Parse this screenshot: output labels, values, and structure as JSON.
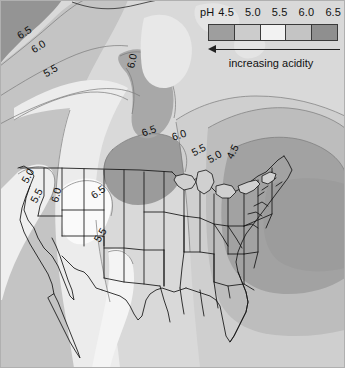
{
  "figure": {
    "name": "precipitation-ph-map-north-america",
    "width": 345,
    "height": 368,
    "ocean_color": "#d9d9d9",
    "outline_color": "#1a1a1a"
  },
  "legend": {
    "ph_label": "pH",
    "ticks": [
      "4.5",
      "5.0",
      "5.5",
      "6.0",
      "6.5"
    ],
    "caption": "increasing acidity",
    "arrow_direction": "left",
    "bands": [
      {
        "ph_range": "<4.5",
        "color": "#9e9e9e"
      },
      {
        "ph_range": "4.5-5.0",
        "color": "#cccccc"
      },
      {
        "ph_range": "5.0-5.5",
        "color": "#f2f2f2"
      },
      {
        "ph_range": "5.5-6.0",
        "color": "#c4c4c4"
      },
      {
        "ph_range": ">6.0",
        "color": "#8f8f8f"
      }
    ]
  },
  "chart_data": {
    "type": "heatmap",
    "title": "",
    "variable": "Precipitation pH",
    "units": "pH",
    "region": "North America",
    "levels": [
      4.5,
      5.0,
      5.5,
      6.0,
      6.5
    ],
    "colors": [
      "#9e9e9e",
      "#cccccc",
      "#f2f2f2",
      "#c4c4c4",
      "#8f8f8f"
    ],
    "legend_position": "top-right",
    "grid": false,
    "contour_labels": [
      {
        "value": "6.5",
        "x": 18,
        "y": 30,
        "rotate": -32
      },
      {
        "value": "6.0",
        "x": 32,
        "y": 44,
        "rotate": -32
      },
      {
        "value": "5.5",
        "x": 44,
        "y": 68,
        "rotate": -30
      },
      {
        "value": "6.0",
        "x": 130,
        "y": 62,
        "rotate": -78
      },
      {
        "value": "6.5",
        "x": 142,
        "y": 127,
        "rotate": -20
      },
      {
        "value": "6.0",
        "x": 172,
        "y": 131,
        "rotate": -18
      },
      {
        "value": "5.5",
        "x": 192,
        "y": 147,
        "rotate": -28
      },
      {
        "value": "5.0",
        "x": 208,
        "y": 154,
        "rotate": -30
      },
      {
        "value": "4.5",
        "x": 229,
        "y": 152,
        "rotate": -64
      },
      {
        "value": "5.0",
        "x": 24,
        "y": 176,
        "rotate": -62
      },
      {
        "value": "5.5",
        "x": 33,
        "y": 196,
        "rotate": -64
      },
      {
        "value": "6.0",
        "x": 54,
        "y": 196,
        "rotate": -76
      },
      {
        "value": "6.5",
        "x": 92,
        "y": 190,
        "rotate": -36
      },
      {
        "value": "5.5",
        "x": 96,
        "y": 235,
        "rotate": -58
      }
    ]
  }
}
